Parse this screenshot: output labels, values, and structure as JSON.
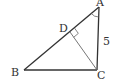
{
  "diagram": {
    "type": "geometry",
    "points": {
      "A": {
        "label": "A",
        "x": 99,
        "y": 7
      },
      "B": {
        "label": "B",
        "x": 24,
        "y": 70
      },
      "C": {
        "label": "C",
        "x": 97,
        "y": 70
      },
      "D": {
        "label": "D",
        "x": 70,
        "y": 32
      }
    },
    "segments": [
      {
        "from": "A",
        "to": "B"
      },
      {
        "from": "B",
        "to": "C"
      },
      {
        "from": "C",
        "to": "A"
      },
      {
        "from": "C",
        "to": "D"
      }
    ],
    "side_labels": {
      "AC": "5"
    },
    "marks": {
      "right_angle_at": "D",
      "angle_arc_at": "A"
    },
    "colors": {
      "stroke": "#333333",
      "altitude": "#666666",
      "background": "#ffffff"
    }
  }
}
